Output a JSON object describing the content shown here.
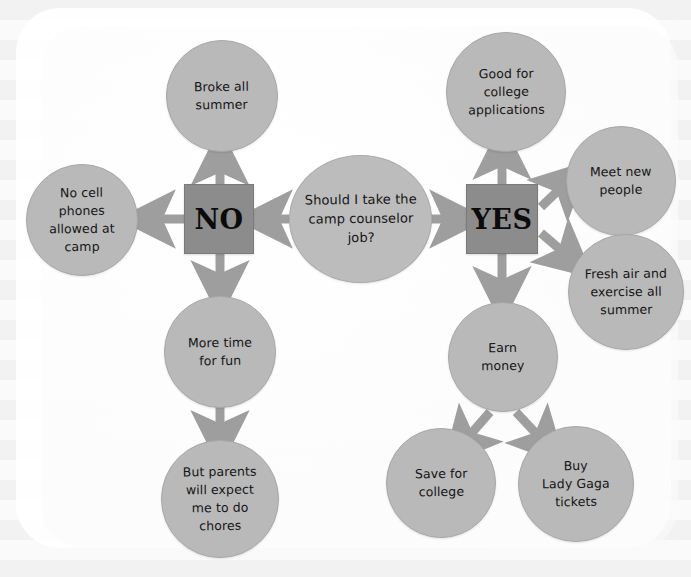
{
  "diagram": {
    "type": "decision-flowchart",
    "title_node": "Should I take the camp counselor job?",
    "style": {
      "node_fill": "#b9b9b9",
      "decision_fill": "#8c8c8c",
      "arrow_color": "#9e9e9e",
      "text_color": "#141414",
      "background": "#fafafa",
      "card": "#ffffff"
    },
    "nodes": [
      {
        "id": "question",
        "label": "Should I take the camp counselor job?",
        "shape": "ellipse"
      },
      {
        "id": "no",
        "label": "NO",
        "shape": "square"
      },
      {
        "id": "yes",
        "label": "YES",
        "shape": "square"
      },
      {
        "id": "broke",
        "label": "Broke all summer",
        "shape": "circle"
      },
      {
        "id": "nocell",
        "label": "No cell phones allowed at camp",
        "shape": "circle"
      },
      {
        "id": "moretime",
        "label": "More time for fun",
        "shape": "circle"
      },
      {
        "id": "chores",
        "label": "But parents will expect me to do chores",
        "shape": "circle"
      },
      {
        "id": "college",
        "label": "Good for college applications",
        "shape": "circle"
      },
      {
        "id": "meetnew",
        "label": "Meet new people",
        "shape": "circle"
      },
      {
        "id": "freshair",
        "label": "Fresh air and exercise all summer",
        "shape": "circle"
      },
      {
        "id": "earnmoney",
        "label": "Earn money",
        "shape": "circle"
      },
      {
        "id": "savecollege",
        "label": "Save for college",
        "shape": "circle"
      },
      {
        "id": "ladygaga",
        "label": "Buy Lady Gaga tickets",
        "shape": "circle"
      }
    ],
    "edges": [
      {
        "from": "question",
        "to": "no",
        "direction": "left"
      },
      {
        "from": "question",
        "to": "yes",
        "direction": "right"
      },
      {
        "from": "no",
        "to": "broke",
        "direction": "up"
      },
      {
        "from": "no",
        "to": "nocell",
        "direction": "left"
      },
      {
        "from": "no",
        "to": "moretime",
        "direction": "down"
      },
      {
        "from": "moretime",
        "to": "chores",
        "direction": "down"
      },
      {
        "from": "yes",
        "to": "college",
        "direction": "up"
      },
      {
        "from": "yes",
        "to": "meetnew",
        "direction": "up-right"
      },
      {
        "from": "yes",
        "to": "freshair",
        "direction": "down-right"
      },
      {
        "from": "yes",
        "to": "earnmoney",
        "direction": "down"
      },
      {
        "from": "earnmoney",
        "to": "savecollege",
        "direction": "down-left"
      },
      {
        "from": "earnmoney",
        "to": "ladygaga",
        "direction": "down-right"
      }
    ]
  },
  "lines": {
    "question": [
      "Should I take the",
      "camp counselor",
      "job?"
    ],
    "broke": [
      "Broke all",
      "summer"
    ],
    "nocell": [
      "No cell",
      "phones",
      "allowed at",
      "camp"
    ],
    "moretime": [
      "More time",
      "for fun"
    ],
    "chores": [
      "But parents",
      "will expect",
      "me to do",
      "chores"
    ],
    "college": [
      "Good for",
      "college",
      "applications"
    ],
    "meetnew": [
      "Meet new",
      "people"
    ],
    "freshair": [
      "Fresh air and",
      "exercise all",
      "summer"
    ],
    "earnmoney": [
      "Earn",
      "money"
    ],
    "savecollege": [
      "Save for",
      "college"
    ],
    "ladygaga": [
      "Buy",
      "Lady Gaga",
      "tickets"
    ],
    "no": [
      "NO"
    ],
    "yes": [
      "YES"
    ]
  }
}
